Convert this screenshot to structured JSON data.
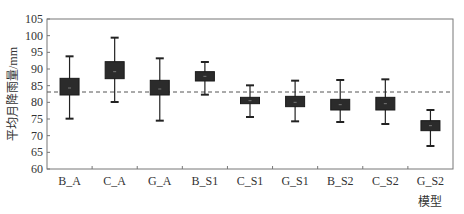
{
  "chart_data": {
    "type": "boxplot",
    "title": "",
    "xlabel": "模型",
    "ylabel": "平均月降雨量/mm",
    "ylim": [
      60,
      105
    ],
    "yticks": [
      60,
      65,
      70,
      75,
      80,
      85,
      90,
      95,
      100,
      105
    ],
    "grid": false,
    "categories": [
      "B_A",
      "C_A",
      "G_A",
      "B_S1",
      "C_S1",
      "G_S1",
      "B_S2",
      "C_S2",
      "G_S2"
    ],
    "series": [
      {
        "name": "whisker_max",
        "values": [
          93.8,
          99.4,
          93.2,
          92.1,
          85.1,
          86.5,
          86.7,
          86.9,
          77.7
        ]
      },
      {
        "name": "q3",
        "values": [
          87.2,
          92.2,
          86.6,
          89.2,
          81.5,
          81.8,
          80.9,
          81.5,
          74.5
        ]
      },
      {
        "name": "mean",
        "values": [
          84.3,
          89.2,
          84.0,
          87.8,
          80.5,
          80.0,
          79.3,
          79.6,
          73.0
        ]
      },
      {
        "name": "q1",
        "values": [
          82.2,
          87.1,
          82.2,
          86.4,
          79.6,
          78.7,
          77.7,
          77.7,
          71.5
        ]
      },
      {
        "name": "whisker_min",
        "values": [
          75.1,
          80.1,
          74.5,
          82.3,
          75.6,
          74.3,
          74.1,
          73.5,
          66.9
        ]
      }
    ],
    "reference_line": {
      "value": 83.1,
      "style": "dashed"
    },
    "colors": {
      "box": "#2b2b2b",
      "whisker": "#222222",
      "reference": "#555555",
      "axis": "#777777"
    }
  }
}
